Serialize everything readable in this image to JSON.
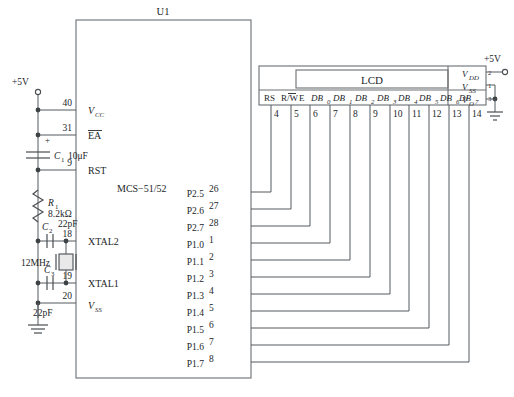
{
  "diagram": {
    "mcu": {
      "ref": "U1",
      "part": "MCS−51/52",
      "left_pins": [
        {
          "number": "40",
          "label": "V",
          "sub": "CC",
          "overline": false
        },
        {
          "number": "31",
          "label": "EA",
          "sub": "",
          "overline": true
        },
        {
          "number": "9",
          "label": "RST",
          "sub": "",
          "overline": false
        },
        {
          "number": "18",
          "label": "XTAL2",
          "sub": "",
          "overline": false
        },
        {
          "number": "19",
          "label": "XTAL1",
          "sub": "",
          "overline": false
        },
        {
          "number": "20",
          "label": "V",
          "sub": "SS",
          "overline": false
        }
      ],
      "right_pins": [
        {
          "port": "P2.5",
          "number": "26"
        },
        {
          "port": "P2.6",
          "number": "27"
        },
        {
          "port": "P2.7",
          "number": "28"
        },
        {
          "port": "P1.0",
          "number": "1"
        },
        {
          "port": "P1.1",
          "number": "2"
        },
        {
          "port": "P1.2",
          "number": "3"
        },
        {
          "port": "P1.3",
          "number": "4"
        },
        {
          "port": "P1.4",
          "number": "5"
        },
        {
          "port": "P1.5",
          "number": "6"
        },
        {
          "port": "P1.6",
          "number": "7"
        },
        {
          "port": "P1.7",
          "number": "8"
        }
      ]
    },
    "lcd": {
      "title": "LCD",
      "signal_pins": [
        {
          "label": "RS",
          "sub": "",
          "number": "4",
          "overline_char": ""
        },
        {
          "label": "R/W",
          "sub": "",
          "number": "5",
          "overline_char": "W"
        },
        {
          "label": "E",
          "sub": "",
          "number": "6",
          "overline_char": ""
        },
        {
          "label": "DB",
          "sub": "0",
          "number": "7",
          "overline_char": ""
        },
        {
          "label": "DB",
          "sub": "1",
          "number": "8",
          "overline_char": ""
        },
        {
          "label": "DB",
          "sub": "2",
          "number": "9",
          "overline_char": ""
        },
        {
          "label": "DB",
          "sub": "3",
          "number": "10",
          "overline_char": ""
        },
        {
          "label": "DB",
          "sub": "4",
          "number": "11",
          "overline_char": ""
        },
        {
          "label": "DB",
          "sub": "5",
          "number": "12",
          "overline_char": ""
        },
        {
          "label": "DB",
          "sub": "6",
          "number": "13",
          "overline_char": ""
        },
        {
          "label": "DB",
          "sub": "7",
          "number": "14",
          "overline_char": ""
        }
      ],
      "power_pins": [
        {
          "label": "V",
          "sub": "DD",
          "number": "2"
        },
        {
          "label": "V",
          "sub": "SS",
          "number": "1"
        },
        {
          "label": "V",
          "sub": "O",
          "number": "3"
        }
      ]
    },
    "components": [
      {
        "ref": "C",
        "sub": "1",
        "value": "10μF",
        "type": "electrolytic-capacitor",
        "polarity": "+"
      },
      {
        "ref": "R",
        "sub": "1",
        "value": "8.2kΩ",
        "type": "resistor"
      },
      {
        "ref": "C",
        "sub": "2",
        "value": "22pF",
        "type": "capacitor"
      },
      {
        "ref": "C",
        "sub": "3",
        "value": "22pF",
        "type": "capacitor"
      },
      {
        "ref": "",
        "sub": "",
        "value": "12MHz",
        "type": "crystal"
      }
    ],
    "power_labels": [
      {
        "text": "+5V",
        "location": "left"
      },
      {
        "text": "+5V",
        "location": "right"
      }
    ],
    "nets": [
      {
        "from": "P2.5",
        "to": "LCD pin 4 (RS)"
      },
      {
        "from": "P2.6",
        "to": "LCD pin 5 (R/W)"
      },
      {
        "from": "P2.7",
        "to": "LCD pin 6 (E)"
      },
      {
        "from": "P1.0",
        "to": "LCD pin 7 (DB0)"
      },
      {
        "from": "P1.1",
        "to": "LCD pin 8 (DB1)"
      },
      {
        "from": "P1.2",
        "to": "LCD pin 9 (DB2)"
      },
      {
        "from": "P1.3",
        "to": "LCD pin 10 (DB3)"
      },
      {
        "from": "P1.4",
        "to": "LCD pin 11 (DB4)"
      },
      {
        "from": "P1.5",
        "to": "LCD pin 12 (DB5)"
      },
      {
        "from": "P1.6",
        "to": "LCD pin 13 (DB6)"
      },
      {
        "from": "P1.7",
        "to": "LCD pin 14 (DB7)"
      }
    ]
  }
}
